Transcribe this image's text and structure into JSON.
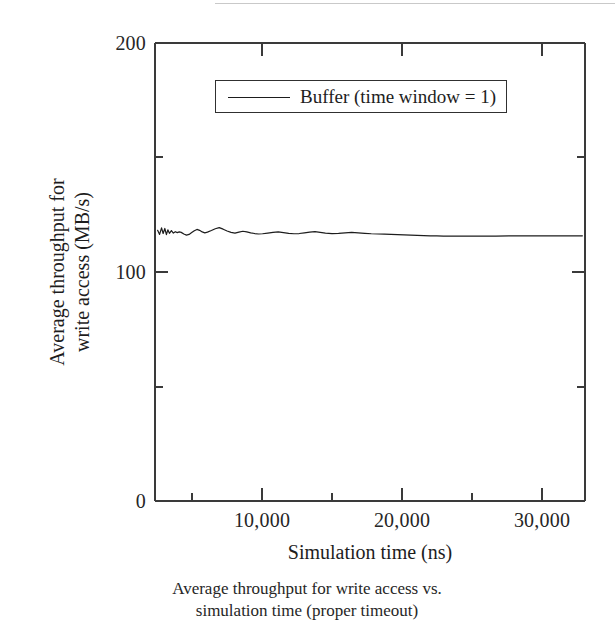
{
  "figure": {
    "caption_lines": [
      "Average throughput for write access vs.",
      "simulation time (proper timeout)"
    ]
  },
  "legend": {
    "entries": [
      {
        "label": "Buffer (time window = 1)",
        "marker": "line-sample"
      }
    ]
  },
  "axes": {
    "y_title_lines": [
      "Average throughput for",
      "write access (MB/s)"
    ],
    "x_title": "Simulation time (ns)",
    "y_ticks": [
      "0",
      "100",
      "200"
    ],
    "x_ticks": [
      "10,000",
      "20,000",
      "30,000"
    ]
  },
  "chart_data": {
    "type": "line",
    "title": "",
    "subtitle": "",
    "xlabel": "Simulation time (ns)",
    "ylabel": "Average throughput for write access (MB/s)",
    "xlim": [
      0,
      32800
    ],
    "ylim": [
      0,
      200
    ],
    "x_ticks": [
      10000,
      20000,
      30000
    ],
    "x_tick_labels": [
      "10,000",
      "20,000",
      "30,000"
    ],
    "x_minor_ticks": [
      5000,
      15000,
      25000
    ],
    "y_ticks": [
      0,
      100,
      200
    ],
    "y_tick_labels": [
      "0",
      "100",
      "200"
    ],
    "y_minor_ticks": [
      50,
      150
    ],
    "grid": false,
    "legend_position": "upper-center",
    "frame": "box",
    "series": [
      {
        "name": "Buffer (time window = 1)",
        "color": "#1d1d1d",
        "line_width": 1.2,
        "x": [
          200,
          350,
          500,
          620,
          750,
          870,
          980,
          1100,
          1250,
          1400,
          1550,
          1700,
          1850,
          2000,
          2200,
          2400,
          2600,
          2800,
          3000,
          3200,
          3400,
          3600,
          3800,
          4000,
          4300,
          4600,
          4900,
          5200,
          5500,
          5800,
          6100,
          6400,
          6700,
          7000,
          7300,
          7600,
          7900,
          8200,
          8600,
          9000,
          9400,
          9800,
          10200,
          10600,
          11000,
          11400,
          11800,
          12200,
          12600,
          13000,
          13500,
          14000,
          14500,
          15000,
          15500,
          16000,
          16500,
          17000,
          17500,
          18000,
          18500,
          19000,
          19500,
          20000,
          20500,
          21000,
          21500,
          22000,
          22500,
          23000,
          23500,
          24000,
          25000,
          26000,
          27000,
          28000,
          29000,
          30000,
          31000,
          32000,
          32600
        ],
        "y": [
          118.2,
          116.4,
          119.3,
          116.8,
          119.0,
          116.3,
          118.4,
          116.9,
          118.1,
          117.0,
          117.6,
          117.2,
          117.5,
          117.3,
          116.6,
          116.1,
          116.4,
          117.2,
          118.0,
          118.6,
          118.2,
          117.5,
          117.1,
          117.4,
          118.1,
          118.9,
          119.4,
          118.7,
          117.9,
          117.3,
          117.0,
          117.4,
          117.8,
          117.5,
          117.1,
          116.8,
          116.6,
          116.7,
          117.0,
          117.3,
          117.5,
          117.2,
          116.9,
          116.7,
          116.8,
          117.1,
          117.4,
          117.6,
          117.3,
          117.0,
          116.8,
          116.9,
          117.1,
          117.3,
          117.1,
          116.9,
          116.7,
          116.6,
          116.5,
          116.4,
          116.3,
          116.2,
          116.1,
          116.0,
          115.9,
          115.8,
          115.8,
          115.7,
          115.7,
          115.7,
          115.7,
          115.7,
          115.7,
          115.7,
          115.8,
          115.8,
          115.8,
          115.8,
          115.8,
          115.8,
          115.8
        ],
        "approx_start_value": 118,
        "approx_steady_value": 116,
        "units": "MB/s"
      }
    ]
  }
}
